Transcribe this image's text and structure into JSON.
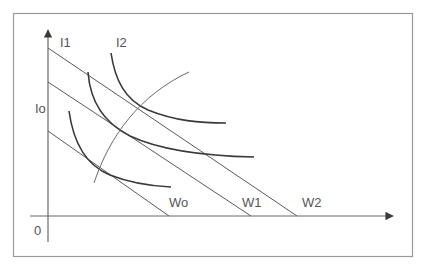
{
  "diagram": {
    "type": "indifference-curves-budget-lines",
    "colors": {
      "frame": "#9a9a9a",
      "axis": "#6a6a6a",
      "budget_line": "#5a5a5a",
      "curve": "#3a3a3a",
      "path": "#6a6a6a",
      "label": "#555555",
      "background": "#ffffff"
    },
    "axes": {
      "origin_label": "0",
      "x_arrow": true,
      "y_arrow": true
    },
    "indifference_curves": [
      {
        "label": "Io"
      },
      {
        "label": "I1"
      },
      {
        "label": "I2"
      }
    ],
    "budget_lines": [
      {
        "label": "Wo"
      },
      {
        "label": "W1"
      },
      {
        "label": "W2"
      }
    ]
  }
}
